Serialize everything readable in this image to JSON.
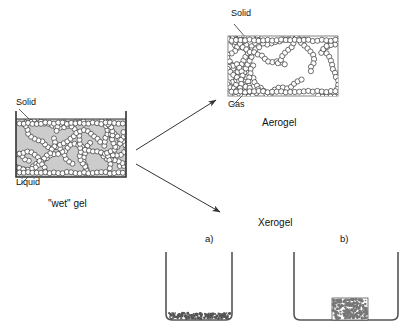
{
  "diagram": {
    "title_hidden": "",
    "wet_gel": {
      "caption": "\"wet\" gel",
      "label_solid": "Solid",
      "label_liquid": "Liquid",
      "fill_color": "#cccccc",
      "bead_fill": "#ffffff",
      "stroke_color": "#333333"
    },
    "aerogel": {
      "caption": "Aerogel",
      "label_solid": "Solid",
      "label_gas": "Gas",
      "fill_color": "#ffffff",
      "bead_fill": "#ffffff",
      "stroke_color": "#333333"
    },
    "xerogel": {
      "caption": "Xerogel",
      "panel_a_letter": "a)",
      "panel_b_letter": "b)",
      "residue_color": "#555555",
      "block_color": "#777777",
      "stroke_color": "#555555"
    },
    "arrows": {
      "to_aerogel": "arrow-up-right",
      "to_xerogel": "arrow-down-right",
      "color": "#333333"
    }
  }
}
